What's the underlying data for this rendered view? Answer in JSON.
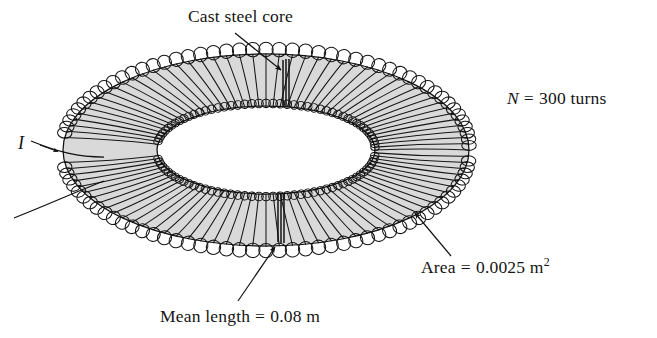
{
  "figure": {
    "background_color": "#ffffff",
    "core_fill_color": "#d9d9d9",
    "core_edge_color": "#1a1a1a",
    "wire_color": "#161616",
    "text_color": "#141414"
  },
  "labels": {
    "core": {
      "text": "Cast steel core",
      "leader": "arrow pointing down-right to top of toroid"
    },
    "turns": {
      "symbol": "N",
      "equals": " = ",
      "value": "300",
      "unit": " turns",
      "full_text": "N = 300 turns"
    },
    "area": {
      "name": "Area",
      "equals": " = ",
      "value": "0.0025",
      "unit": "m",
      "exponent": "2",
      "full_text": "Area = 0.0025 m2",
      "leader": "arrow pointing up-left to lower-right of toroid"
    },
    "mean_length": {
      "name": "Mean length",
      "equals": " = ",
      "value": "0.08",
      "unit": " m",
      "full_text": "Mean length = 0.08 m",
      "leader": "arrow pointing up-right to bottom of toroid"
    },
    "current": {
      "symbol": "I",
      "full_text": "I",
      "leader": "arrow on lead wire pointing right into coil"
    }
  },
  "geometry": {
    "center_x": 266,
    "center_y": 150,
    "outer_rx": 203,
    "outer_ry": 96,
    "tube_rx": 47,
    "tube_ry": 26,
    "turn_count_drawn": 96
  }
}
